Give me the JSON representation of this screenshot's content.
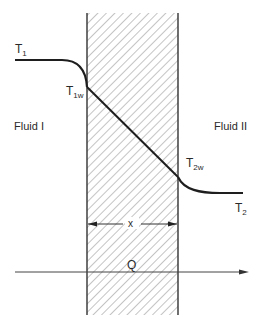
{
  "diagram": {
    "labels": {
      "t1": "T",
      "t1_sub": "1",
      "t1w": "T",
      "t1w_sub": "1w",
      "t2w": "T",
      "t2w_sub": "2w",
      "t2": "T",
      "t2_sub": "2",
      "fluid_left": "Fluid I",
      "fluid_right": "Fluid II",
      "thickness": "x",
      "heat_flow": "Q"
    },
    "colors": {
      "line": "#1e1e1e",
      "hatch": "#7a7a7a",
      "background": "#ffffff"
    }
  }
}
